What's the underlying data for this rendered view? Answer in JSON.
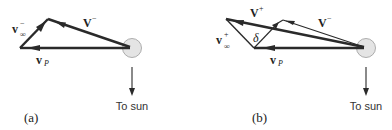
{
  "panels": [
    {
      "id": "a",
      "panel_label": "(a)",
      "sun_label": "To sun",
      "vectors": {
        "v_inf": {
          "base": "v",
          "sup": "−",
          "sub": "∞"
        },
        "v_minus": {
          "base": "V",
          "sup": "−"
        },
        "v_p": {
          "base": "v",
          "sub": "P"
        }
      }
    },
    {
      "id": "b",
      "panel_label": "(b)",
      "sun_label": "To sun",
      "vectors": {
        "v_plus": {
          "base": "V",
          "sup": "+"
        },
        "v_minus": {
          "base": "V",
          "sup": "−"
        },
        "v_inf": {
          "base": "v",
          "sup": "+",
          "sub": "∞"
        },
        "delta": {
          "symbol": "δ"
        },
        "v_p": {
          "base": "v",
          "sub": "P"
        }
      }
    }
  ],
  "colors": {
    "planet_fill": "#e4e4e4",
    "planet_stroke": "#9a9a9a",
    "vector": "#2a2a2a"
  }
}
